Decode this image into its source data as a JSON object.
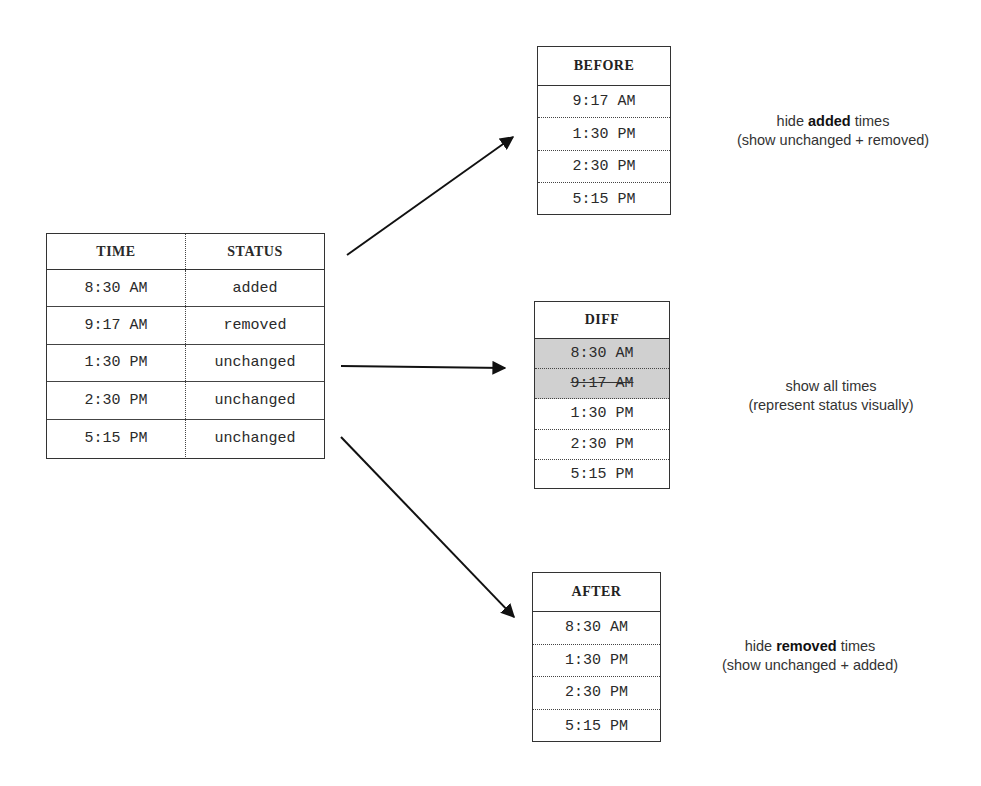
{
  "main_table": {
    "headers": [
      "TIME",
      "STATUS"
    ],
    "rows": [
      {
        "time": "8:30 AM",
        "status": "added"
      },
      {
        "time": "9:17 AM",
        "status": "removed"
      },
      {
        "time": "1:30 PM",
        "status": "unchanged"
      },
      {
        "time": "2:30 PM",
        "status": "unchanged"
      },
      {
        "time": "5:15 PM",
        "status": "unchanged"
      }
    ]
  },
  "before": {
    "title": "BEFORE",
    "rows": [
      "9:17 AM",
      "1:30 PM",
      "2:30 PM",
      "5:15 PM"
    ],
    "caption": {
      "pre": "hide ",
      "bold": "added",
      "post": " times",
      "line2": "(show unchanged + removed)"
    }
  },
  "diff": {
    "title": "DIFF",
    "rows": [
      {
        "time": "8:30 AM",
        "style": "shaded"
      },
      {
        "time": "9:17 AM",
        "style": "shaded-strikethrough"
      },
      {
        "time": "1:30 PM",
        "style": "normal"
      },
      {
        "time": "2:30 PM",
        "style": "normal"
      },
      {
        "time": "5:15 PM",
        "style": "normal"
      }
    ],
    "shade_color": "#d0d0d0",
    "caption": {
      "line1": "show all times",
      "line2": "(represent status visually)"
    }
  },
  "after": {
    "title": "AFTER",
    "rows": [
      "8:30 AM",
      "1:30 PM",
      "2:30 PM",
      "5:15 PM"
    ],
    "caption": {
      "pre": "hide ",
      "bold": "removed",
      "post": " times",
      "line2": "(show unchanged + added)"
    }
  }
}
